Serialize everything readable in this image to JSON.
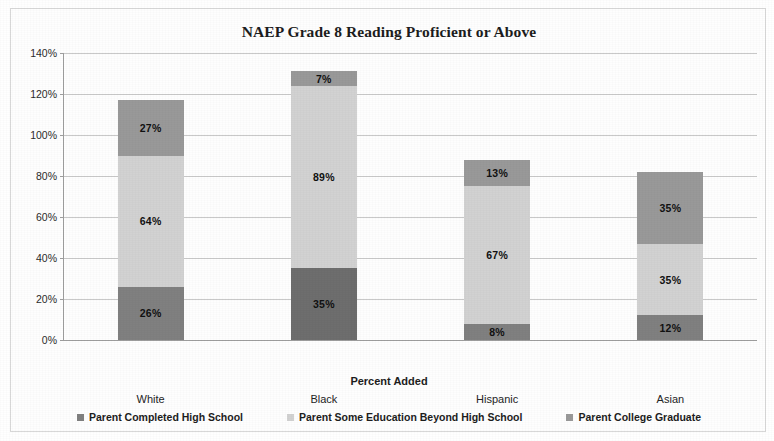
{
  "chart_data": {
    "type": "bar",
    "subtype": "stacked-bar",
    "title": "NAEP Grade 8 Reading Proficient or Above",
    "xlabel": "Percent Added",
    "ylabel": "",
    "categories": [
      "White",
      "Black",
      "Hispanic",
      "Asian"
    ],
    "series": [
      {
        "name": "Parent Completed High School",
        "color": "#808080",
        "values": [
          26,
          35,
          8,
          12
        ],
        "labels": [
          "26%",
          "35%",
          "8%",
          "12%"
        ]
      },
      {
        "name": "Parent Some Education Beyond High School",
        "color": "#d2d2d2",
        "values": [
          64,
          89,
          67,
          35
        ],
        "labels": [
          "64%",
          "89%",
          "67%",
          "35%"
        ]
      },
      {
        "name": "Parent College Graduate",
        "color": "#999999",
        "values": [
          27,
          7,
          13,
          35
        ],
        "labels": [
          "27%",
          "7%",
          "13%",
          "35%"
        ]
      }
    ],
    "totals": [
      117,
      131,
      88,
      82
    ],
    "ylim": [
      0,
      140
    ],
    "ytick_step": 20,
    "ytick_labels": [
      "0%",
      "20%",
      "40%",
      "60%",
      "80%",
      "100%",
      "120%",
      "140%"
    ],
    "ytick_values": [
      0,
      20,
      40,
      60,
      80,
      100,
      120,
      140
    ],
    "grid": true,
    "grid_axis": "y",
    "legend_position": "bottom",
    "legend_entries": [
      "Parent Completed High School",
      "Parent Some Education Beyond High School",
      "Parent College Graduate"
    ],
    "bar_segment_overrides": {
      "Black": {
        "Parent Completed High School": "#6e6e6e"
      }
    }
  }
}
